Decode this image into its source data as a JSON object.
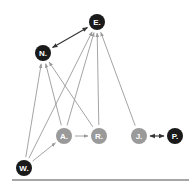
{
  "diagram": {
    "colors": {
      "dark_node": "#1a1a1a",
      "light_node": "#9a9a9a",
      "edge": "#9a9a9a",
      "bidirectional_edge": "#333333",
      "baseline": "#8a8a8a",
      "label": "#ffffff"
    },
    "nodes": [
      {
        "id": "E",
        "label": "E.",
        "style": "dark"
      },
      {
        "id": "N",
        "label": "N.",
        "style": "dark"
      },
      {
        "id": "A",
        "label": "A.",
        "style": "light"
      },
      {
        "id": "R",
        "label": "R.",
        "style": "light"
      },
      {
        "id": "J",
        "label": "J.",
        "style": "light"
      },
      {
        "id": "P",
        "label": "P.",
        "style": "dark"
      },
      {
        "id": "W",
        "label": "W.",
        "style": "dark"
      }
    ],
    "edges": [
      {
        "from": "N",
        "to": "E",
        "type": "bidirectional"
      },
      {
        "from": "W",
        "to": "N",
        "type": "directed"
      },
      {
        "from": "A",
        "to": "N",
        "type": "directed"
      },
      {
        "from": "R",
        "to": "N",
        "type": "directed"
      },
      {
        "from": "W",
        "to": "E",
        "type": "directed"
      },
      {
        "from": "A",
        "to": "E",
        "type": "directed"
      },
      {
        "from": "R",
        "to": "E",
        "type": "directed"
      },
      {
        "from": "J",
        "to": "E",
        "type": "directed"
      },
      {
        "from": "A",
        "to": "R",
        "type": "directed"
      },
      {
        "from": "W",
        "to": "A",
        "type": "directed"
      },
      {
        "from": "J",
        "to": "P",
        "type": "bidirectional"
      }
    ]
  }
}
